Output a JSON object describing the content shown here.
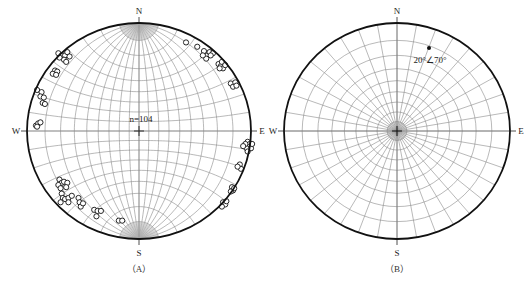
{
  "figure": {
    "panels": [
      {
        "id": "A",
        "caption": "（A）",
        "type": "equatorial-net",
        "directions": {
          "north": "N",
          "south": "S",
          "east": "E",
          "west": "W"
        },
        "count_label": "n=104",
        "center": [
          139,
          131
        ],
        "radius": [
          112,
          108
        ],
        "grid_step_deg": 10,
        "poles": [
          [
            0.42,
            0.82
          ],
          [
            0.52,
            0.78
          ],
          [
            0.58,
            0.74
          ],
          [
            0.61,
            0.7
          ],
          [
            0.63,
            0.73
          ],
          [
            0.66,
            0.72
          ],
          [
            0.6,
            0.67
          ],
          [
            0.64,
            0.7
          ],
          [
            0.57,
            0.7
          ],
          [
            0.71,
            0.62
          ],
          [
            0.73,
            0.6
          ],
          [
            0.75,
            0.58
          ],
          [
            0.74,
            0.64
          ],
          [
            0.77,
            0.61
          ],
          [
            0.72,
            0.58
          ],
          [
            0.82,
            0.44
          ],
          [
            0.84,
            0.41
          ],
          [
            0.86,
            0.45
          ],
          [
            0.87,
            0.42
          ],
          [
            0.97,
            -0.1
          ],
          [
            0.99,
            -0.12
          ],
          [
            0.98,
            -0.15
          ],
          [
            1.0,
            -0.16
          ],
          [
            0.96,
            -0.16
          ],
          [
            0.95,
            -0.12
          ],
          [
            1.01,
            -0.12
          ],
          [
            0.97,
            -0.19
          ],
          [
            0.93,
            -0.14
          ],
          [
            0.9,
            -0.31
          ],
          [
            0.91,
            -0.35
          ],
          [
            0.88,
            -0.33
          ],
          [
            0.83,
            -0.52
          ],
          [
            0.84,
            -0.55
          ],
          [
            0.82,
            -0.56
          ],
          [
            0.85,
            -0.53
          ],
          [
            0.75,
            -0.66
          ],
          [
            0.77,
            -0.68
          ],
          [
            0.74,
            -0.7
          ],
          [
            0.78,
            -0.65
          ],
          [
            -0.72,
            0.72
          ],
          [
            -0.69,
            0.7
          ],
          [
            -0.66,
            0.7
          ],
          [
            -0.64,
            0.73
          ],
          [
            -0.67,
            0.66
          ],
          [
            -0.71,
            0.68
          ],
          [
            -0.62,
            0.69
          ],
          [
            -0.65,
            0.64
          ],
          [
            -0.75,
            0.56
          ],
          [
            -0.73,
            0.55
          ],
          [
            -0.77,
            0.53
          ],
          [
            -0.74,
            0.52
          ],
          [
            -0.91,
            0.38
          ],
          [
            -0.87,
            0.36
          ],
          [
            -0.88,
            0.32
          ],
          [
            -0.85,
            0.31
          ],
          [
            -0.86,
            0.26
          ],
          [
            -0.84,
            0.25
          ],
          [
            -0.92,
            0.05
          ],
          [
            -0.9,
            0.07
          ],
          [
            -0.88,
            0.08
          ],
          [
            -0.91,
            0.04
          ],
          [
            -0.71,
            -0.45
          ],
          [
            -0.69,
            -0.48
          ],
          [
            -0.72,
            -0.5
          ],
          [
            -0.67,
            -0.47
          ],
          [
            -0.64,
            -0.48
          ],
          [
            -0.65,
            -0.52
          ],
          [
            -0.7,
            -0.53
          ],
          [
            -0.69,
            -0.58
          ],
          [
            -0.68,
            -0.62
          ],
          [
            -0.7,
            -0.66
          ],
          [
            -0.66,
            -0.63
          ],
          [
            -0.63,
            -0.62
          ],
          [
            -0.6,
            -0.6
          ],
          [
            -0.63,
            -0.66
          ],
          [
            -0.54,
            -0.62
          ],
          [
            -0.53,
            -0.66
          ],
          [
            -0.52,
            -0.7
          ],
          [
            -0.5,
            -0.67
          ],
          [
            -0.4,
            -0.73
          ],
          [
            -0.37,
            -0.74
          ],
          [
            -0.34,
            -0.74
          ],
          [
            -0.38,
            -0.79
          ],
          [
            -0.18,
            -0.83
          ],
          [
            -0.15,
            -0.83
          ]
        ]
      },
      {
        "id": "B",
        "caption": "（B）",
        "type": "polar-net",
        "directions": {
          "north": "N",
          "south": "S",
          "east": "E",
          "west": "W"
        },
        "annotation": "20°∠70°",
        "center": [
          397,
          131
        ],
        "radius": [
          113,
          108
        ],
        "grid_step_deg": 10,
        "point": {
          "dip_direction_deg": 20,
          "dip_deg": 70,
          "xy": [
            429,
            48
          ]
        }
      }
    ]
  },
  "colors": {
    "outline": "#111111",
    "grid": "#8a8a8a",
    "text": "#222222",
    "background": "#ffffff"
  }
}
